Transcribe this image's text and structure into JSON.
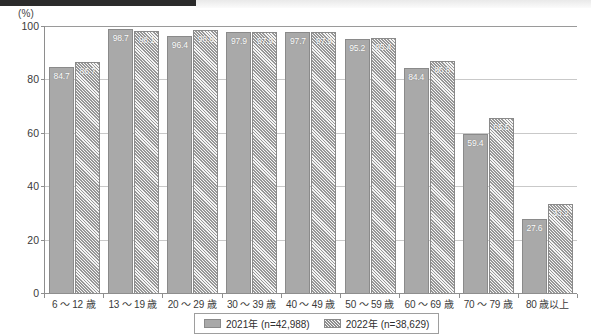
{
  "chart_data": {
    "type": "bar",
    "title": "",
    "subtitle": "",
    "xlabel": "",
    "ylabel": "",
    "y_unit_label": "(%)",
    "ylim": [
      0,
      100
    ],
    "yticks": [
      0,
      20,
      40,
      60,
      80,
      100
    ],
    "ytick_labels": [
      "0",
      "20",
      "40",
      "60",
      "80",
      "100"
    ],
    "grid": true,
    "legend_position": "bottom-center",
    "categories": [
      "6 〜 12 歳",
      "13 〜 19 歳",
      "20 〜 29 歳",
      "30 〜 39 歳",
      "40 〜 49 歳",
      "50 〜 59 歳",
      "60 〜 69 歳",
      "70 〜 79 歳",
      "80 歳以上"
    ],
    "series": [
      {
        "name": "2021年 (n=42,988)",
        "short_name": "2021年",
        "sample_size": "n=42,988",
        "fill": "solid",
        "color": "#a9a9a9",
        "values": [
          84.7,
          98.7,
          96.4,
          97.9,
          97.7,
          95.2,
          84.4,
          59.4,
          27.6
        ],
        "value_labels": [
          "84.7",
          "98.7",
          "96.4",
          "97.9",
          "97.7",
          "95.2",
          "84.4",
          "59.4",
          "27.6"
        ]
      },
      {
        "name": "2022年 (n=38,629)",
        "short_name": "2022年",
        "sample_size": "n=38,629",
        "fill": "hatched",
        "color": "#bdbdbd",
        "values": [
          86.7,
          98.1,
          98.6,
          97.9,
          97.9,
          95.4,
          86.8,
          65.5,
          33.2
        ],
        "value_labels": [
          "86.7",
          "98.1",
          "98.6",
          "97.9",
          "97.9",
          "95.4",
          "86.8",
          "65.5",
          "33.2"
        ]
      }
    ]
  }
}
